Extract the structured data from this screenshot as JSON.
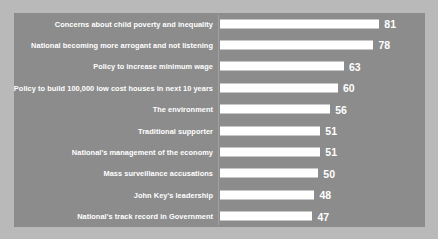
{
  "chart_data": {
    "type": "bar",
    "orientation": "horizontal",
    "title": "",
    "subtitle": "",
    "xlabel": "",
    "ylabel": "",
    "grid": false,
    "legend": "none",
    "axis_value_scale_min": 0,
    "axis_value_scale_max": 90,
    "categories": [
      "Concerns about child poverty and inequality",
      "National becoming more arrogant and not listening",
      "Policy to increase minimum wage",
      "Policy to build 100,000 low cost houses in next 10 years",
      "The environment",
      "Traditional supporter",
      "National's management of the economy",
      "Mass surveillance accusations",
      "John Key's leadership",
      "National's track record in Government"
    ],
    "values": [
      81,
      78,
      63,
      60,
      56,
      51,
      51,
      50,
      48,
      47
    ],
    "bars": [
      {
        "label": "Concerns about child poverty and inequality",
        "value": 81,
        "value_text": "81"
      },
      {
        "label": "National becoming more arrogant and not listening",
        "value": 78,
        "value_text": "78"
      },
      {
        "label": "Policy to increase minimum wage",
        "value": 63,
        "value_text": "63"
      },
      {
        "label": "Policy to build 100,000 low cost houses in next 10 years",
        "value": 60,
        "value_text": "60"
      },
      {
        "label": "The environment",
        "value": 56,
        "value_text": "56"
      },
      {
        "label": "Traditional supporter",
        "value": 51,
        "value_text": "51"
      },
      {
        "label": "National's management of the economy",
        "value": 51,
        "value_text": "51"
      },
      {
        "label": "Mass surveillance accusations",
        "value": 50,
        "value_text": "50"
      },
      {
        "label": "John Key's leadership",
        "value": 48,
        "value_text": "48"
      },
      {
        "label": "National's track record in Government",
        "value": 47,
        "value_text": "47"
      }
    ],
    "colors": {
      "bar_fill": "#ffffff",
      "plot_background": "#8c8c8c",
      "outer_background": "#b9b9b9",
      "label_text": "#ffffff",
      "value_text": "#ffffff",
      "axis_line": "#a0a0a0"
    }
  }
}
